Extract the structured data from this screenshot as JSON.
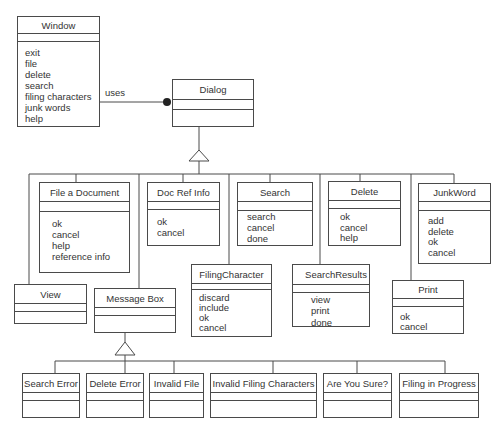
{
  "diagram": {
    "type": "UML class diagram",
    "classes": {
      "window": {
        "name": "Window",
        "operations": [
          "exit",
          "file",
          "delete",
          "search",
          "filing characters",
          "junk words",
          "help"
        ]
      },
      "dialog": {
        "name": "Dialog",
        "operations": []
      },
      "file_a_document": {
        "name": "File a Document",
        "operations": [
          "ok",
          "cancel",
          "help",
          "reference info"
        ]
      },
      "doc_ref_info": {
        "name": "Doc Ref Info",
        "operations": [
          "ok",
          "cancel"
        ]
      },
      "search": {
        "name": "Search",
        "operations": [
          "search",
          "cancel",
          "done"
        ]
      },
      "delete": {
        "name": "Delete",
        "operations": [
          "ok",
          "cancel",
          "help"
        ]
      },
      "junkword": {
        "name": "JunkWord",
        "operations": [
          "add",
          "delete",
          "ok",
          "cancel"
        ]
      },
      "view": {
        "name": "View",
        "operations": []
      },
      "message_box": {
        "name": "Message Box",
        "operations": []
      },
      "filing_character": {
        "name": "FilingCharacter",
        "operations": [
          "discard",
          "include",
          "ok",
          "cancel"
        ]
      },
      "search_results": {
        "name": "SearchResults",
        "operations": [
          "view",
          "print",
          "done"
        ]
      },
      "print": {
        "name": "Print",
        "operations": [
          "ok",
          "cancel"
        ]
      },
      "search_error": {
        "name": "Search Error",
        "operations": []
      },
      "delete_error": {
        "name": "Delete Error",
        "operations": []
      },
      "invalid_file": {
        "name": "Invalid File",
        "operations": []
      },
      "invalid_filing_characters": {
        "name": "Invalid Filing Characters",
        "operations": []
      },
      "are_you_sure": {
        "name": "Are You Sure?",
        "operations": []
      },
      "filing_in_progress": {
        "name": "Filing in Progress",
        "operations": []
      }
    },
    "relationships": [
      {
        "type": "association",
        "from": "Window",
        "to": "Dialog",
        "label": "uses"
      },
      {
        "type": "generalization",
        "parent": "Dialog",
        "children": [
          "View",
          "File a Document",
          "Message Box",
          "Doc Ref Info",
          "FilingCharacter",
          "Search",
          "SearchResults",
          "Delete",
          "Print",
          "JunkWord"
        ]
      },
      {
        "type": "generalization",
        "parent": "Message Box",
        "children": [
          "Search Error",
          "Delete Error",
          "Invalid File",
          "Invalid Filing Characters",
          "Are You Sure?",
          "Filing in Progress"
        ]
      }
    ],
    "association_label": "uses",
    "colors": {
      "line": "#4a4a4a",
      "text": "#333333",
      "background": "#ffffff"
    }
  }
}
